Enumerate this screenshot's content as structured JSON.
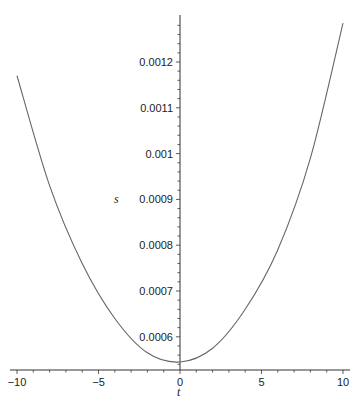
{
  "chart_data": {
    "type": "line",
    "title": "",
    "xlabel": "t",
    "ylabel": "s",
    "xlim": [
      -10,
      10
    ],
    "ylim": [
      0.00053,
      0.00129
    ],
    "grid": false,
    "legend": null,
    "x_ticks": [
      -10,
      -5,
      0,
      5,
      10
    ],
    "x_tick_labels": [
      "-10",
      "-5",
      "0",
      "5",
      "10"
    ],
    "y_ticks": [
      0.0006,
      0.0007,
      0.0008,
      0.0009,
      0.001,
      0.0011,
      0.0012
    ],
    "y_tick_labels": [
      "0.0006",
      "0.0007",
      "0.0008",
      "0.0009",
      "0.001",
      "0.0011",
      "0.0012"
    ],
    "series": [
      {
        "name": "s(t)",
        "color": "#666666",
        "x": [
          -10,
          -8,
          -6,
          -4,
          -2,
          0,
          2,
          4,
          6,
          8,
          10
        ],
        "values": [
          0.00117,
          0.00093,
          0.00076,
          0.00064,
          0.000565,
          0.000545,
          0.000575,
          0.00066,
          0.00079,
          0.00099,
          0.001285
        ]
      }
    ]
  }
}
